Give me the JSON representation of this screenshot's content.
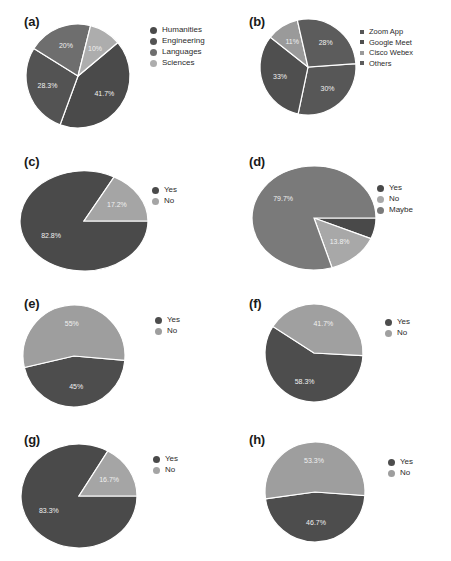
{
  "figure": {
    "background": "#ffffff",
    "palette": {
      "dark": "#4a4a4a",
      "mid": "#6e6e6e",
      "light": "#adadad",
      "pale": "#c9c9c9",
      "separator": "#ffffff",
      "label_text": "#f0f0f0",
      "legend_text": "#2b2b2b"
    }
  },
  "panels": [
    {
      "id": "a",
      "label": "(a)",
      "legend_marker": "circle",
      "chart_data": {
        "type": "pie",
        "title": "",
        "labels": [
          "Humanities",
          "Engineering",
          "Languages",
          "Sciences"
        ],
        "values": [
          41.7,
          28.3,
          20,
          10
        ],
        "value_labels": [
          "41.7%",
          "28.3%",
          "20%",
          "10%"
        ],
        "colors": [
          "#4a4a4a",
          "#535353",
          "#6e6e6e",
          "#adadad"
        ],
        "legend_position": "right",
        "start_angle": -40
      }
    },
    {
      "id": "b",
      "label": "(b)",
      "legend_marker": "square",
      "chart_data": {
        "type": "pie",
        "title": "",
        "labels": [
          "Zoom App",
          "Google Meet",
          "Cisco Webex",
          "Others"
        ],
        "values": [
          30,
          33,
          11,
          28
        ],
        "value_labels": [
          "30%",
          "33%",
          "11%",
          "28%"
        ],
        "colors": [
          "#575757",
          "#4f4f4f",
          "#9a9a9a",
          "#5c5c5c"
        ],
        "legend_position": "right",
        "start_angle": -4
      }
    },
    {
      "id": "c",
      "label": "(c)",
      "legend_marker": "circle",
      "chart_data": {
        "type": "pie",
        "title": "",
        "labels": [
          "Yes",
          "No"
        ],
        "values": [
          82.8,
          17.2
        ],
        "value_labels": [
          "82.8%",
          "17.2%"
        ],
        "colors": [
          "#4a4a4a",
          "#a5a5a5"
        ],
        "legend_position": "right",
        "start_angle": 0
      }
    },
    {
      "id": "d",
      "label": "(d)",
      "legend_marker": "circle",
      "chart_data": {
        "type": "pie",
        "title": "",
        "labels": [
          "Yes",
          "No",
          "Maybe"
        ],
        "values": [
          6.5,
          13.8,
          79.7
        ],
        "value_labels": [
          "",
          "13.8%",
          "79.7%"
        ],
        "colors": [
          "#494949",
          "#a8a8a8",
          "#7a7a7a"
        ],
        "legend_position": "right",
        "start_angle": 0
      }
    },
    {
      "id": "e",
      "label": "(e)",
      "legend_marker": "circle",
      "chart_data": {
        "type": "pie",
        "title": "",
        "labels": [
          "Yes",
          "No"
        ],
        "values": [
          45,
          55
        ],
        "value_labels": [
          "45%",
          "55%"
        ],
        "colors": [
          "#4d4d4d",
          "#9e9e9e"
        ],
        "legend_position": "right",
        "start_angle": 5
      }
    },
    {
      "id": "f",
      "label": "(f)",
      "legend_marker": "circle",
      "chart_data": {
        "type": "pie",
        "title": "",
        "labels": [
          "Yes",
          "No"
        ],
        "values": [
          58.3,
          41.7
        ],
        "value_labels": [
          "58.3%",
          "41.7%"
        ],
        "colors": [
          "#4d4d4d",
          "#a0a0a0"
        ],
        "legend_position": "right",
        "start_angle": 3
      }
    },
    {
      "id": "g",
      "label": "(g)",
      "legend_marker": "circle",
      "chart_data": {
        "type": "pie",
        "title": "",
        "labels": [
          "Yes",
          "No"
        ],
        "values": [
          83.3,
          16.7
        ],
        "value_labels": [
          "83.3%",
          "16.7%"
        ],
        "colors": [
          "#4a4a4a",
          "#a5a5a5"
        ],
        "legend_position": "right",
        "start_angle": 0
      }
    },
    {
      "id": "h",
      "label": "(h)",
      "legend_marker": "circle",
      "chart_data": {
        "type": "pie",
        "title": "",
        "labels": [
          "Yes",
          "No"
        ],
        "values": [
          46.7,
          53.3
        ],
        "value_labels": [
          "46.7%",
          "53.3%"
        ],
        "colors": [
          "#4d4d4d",
          "#9e9e9e"
        ],
        "legend_position": "right",
        "start_angle": 4
      }
    }
  ]
}
